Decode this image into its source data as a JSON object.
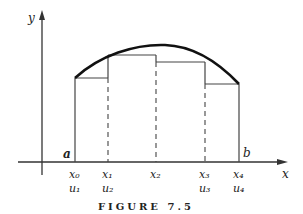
{
  "figure": {
    "caption": "FIGURE 7.5",
    "axes": {
      "x_label": "x",
      "y_label": "y"
    },
    "endpoints": {
      "a": "a",
      "b": "b"
    },
    "ticks": [
      {
        "x_label": "x₀",
        "u_label": "u₁"
      },
      {
        "x_label": "x₁",
        "u_label": "u₂"
      },
      {
        "x_label": "x₂",
        "u_label": ""
      },
      {
        "x_label": "x₃",
        "u_label": "u₃"
      },
      {
        "x_label": "x₄",
        "u_label": "u₄"
      }
    ]
  }
}
